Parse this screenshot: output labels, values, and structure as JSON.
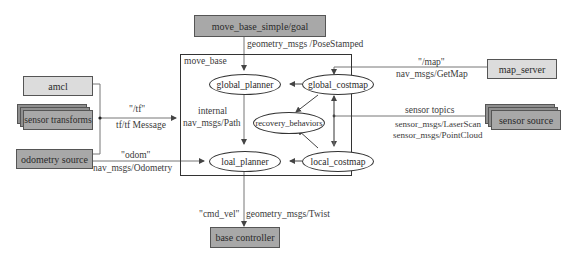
{
  "nodes": {
    "goal": "move_base_simple/goal",
    "container": "move_base",
    "amcl": "amcl",
    "sensor_transforms": "sensor transforms",
    "odometry_source": "odometry source",
    "map_server": "map_server",
    "sensor_source": "sensor source",
    "base_controller": "base controller",
    "global_planner": "global_planner",
    "global_costmap": "global_costmap",
    "recovery_behaviors": "recovery_behaviors",
    "local_planner": "loal_planner",
    "local_costmap": "local_costmap"
  },
  "edges": {
    "goal_msg": "geometry_msgs /PoseStamped",
    "tf_topic": "\"/tf\"",
    "tf_msg": "tf/tf Message",
    "odom_topic": "\"odom\"",
    "odom_msg": "nav_msgs/Odometry",
    "internal": "internal",
    "path_msg": "nav_msgs/Path",
    "map_topic": "\"/map\"",
    "map_msg": "nav_msgs/GetMap",
    "sensor_topics": "sensor topics",
    "laser_msg": "sensor_msgs/LaserScan",
    "pointcloud_msg": "sensor_msgs/PointCloud",
    "cmd_vel": "\"cmd_vel\"",
    "twist_msg": "geometry_msgs/Twist"
  }
}
